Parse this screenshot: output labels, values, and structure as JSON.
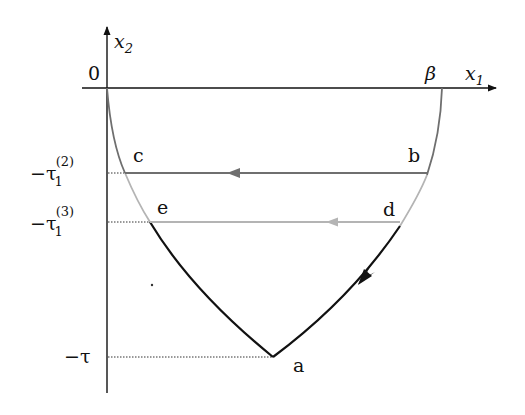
{
  "figure": {
    "type": "phase-plane diagram",
    "axes": {
      "x_label": "x",
      "x_label_sub": "1",
      "y_label": "x",
      "y_label_sub": "2",
      "origin_label": "0"
    },
    "x_axis_marks": [
      {
        "label": "β",
        "position": "x1 = β"
      }
    ],
    "y_axis_marks": [
      {
        "label_main": "−τ",
        "label_sub": "1",
        "label_sup": "(2)",
        "level": "c-b line"
      },
      {
        "label_main": "−τ",
        "label_sub": "1",
        "label_sup": "(3)",
        "level": "e-d line"
      },
      {
        "label_main": "−τ",
        "label_sub": "",
        "label_sup": "",
        "level": "vertex a"
      }
    ],
    "points": [
      {
        "name": "a",
        "label": "a"
      },
      {
        "name": "b",
        "label": "b"
      },
      {
        "name": "c",
        "label": "c"
      },
      {
        "name": "d",
        "label": "d"
      },
      {
        "name": "e",
        "label": "e"
      }
    ],
    "segments": [
      {
        "from": "b",
        "to": "c",
        "style": "horizontal with left arrow",
        "color": "#6f6f6f"
      },
      {
        "from": "d",
        "to": "e",
        "style": "horizontal with left arrow",
        "color": "#b4b4b4"
      },
      {
        "from": "d",
        "to": "a",
        "style": "curve with arrow toward a",
        "color": "#111111"
      },
      {
        "from": "a",
        "to": "e",
        "style": "curve",
        "color": "#111111"
      },
      {
        "from": "0",
        "to": "c",
        "style": "curve",
        "color": "#6f6f6f"
      },
      {
        "from": "c",
        "to": "e",
        "style": "curve",
        "color": "#b4b4b4"
      },
      {
        "from": "β",
        "to": "b",
        "style": "curve",
        "color": "#6f6f6f"
      },
      {
        "from": "b",
        "to": "d",
        "style": "curve",
        "color": "#b4b4b4"
      }
    ],
    "colors": {
      "axis": "#111111",
      "dark_gray": "#6f6f6f",
      "light_gray": "#b4b4b4",
      "black_curve": "#111111",
      "dotted_guide": "#333333"
    }
  }
}
